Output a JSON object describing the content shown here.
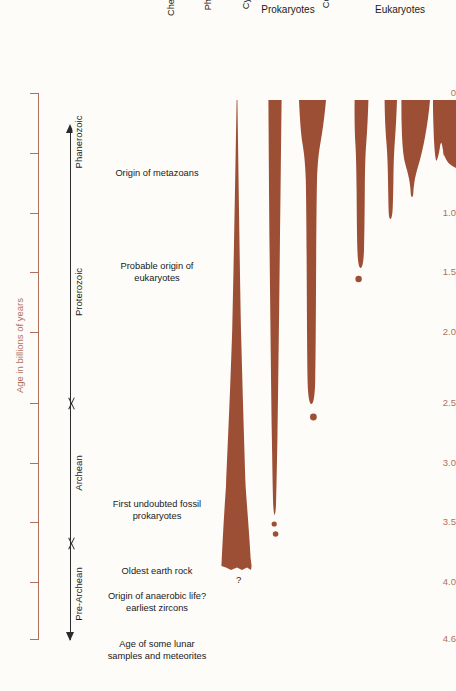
{
  "axis": {
    "title": "Age in billions of years",
    "unit": "billions of years",
    "color": "#b0705c",
    "ticks": [
      {
        "value": "0",
        "y": 93
      },
      {
        "value": "0.5",
        "y": 153
      },
      {
        "value": "1.0",
        "y": 213
      },
      {
        "value": "1.5",
        "y": 272
      },
      {
        "value": "2.0",
        "y": 332
      },
      {
        "value": "2.5",
        "y": 403
      },
      {
        "value": "3.0",
        "y": 463
      },
      {
        "value": "3.5",
        "y": 522
      },
      {
        "value": "4.0",
        "y": 582
      },
      {
        "value": "4.6",
        "y": 639
      }
    ],
    "range": [
      0,
      4.6
    ]
  },
  "eras": [
    {
      "label": "Phanerozoic",
      "top": 104,
      "bottom": 180
    },
    {
      "label": "Proterozoic",
      "top": 180,
      "bottom": 403
    },
    {
      "label": "Archean",
      "top": 403,
      "bottom": 543
    },
    {
      "label": "Pre-Archean",
      "top": 543,
      "bottom": 645
    }
  ],
  "era_boundaries": [
    {
      "name": "archean-proterozoic-boundary",
      "y": 403
    },
    {
      "name": "pre-archean-archean-boundary",
      "y": 543
    }
  ],
  "annotations": [
    {
      "text": "Origin of metazoans",
      "y": 173,
      "age": "0.7"
    },
    {
      "text": "Probable origin of\neukaryotes",
      "y": 272,
      "age": "1.5"
    },
    {
      "text": "First undoubted fossil\nprokaryotes",
      "y": 510,
      "age": "3.4"
    },
    {
      "text": "Oldest earth rock",
      "y": 571,
      "age": "3.8"
    },
    {
      "text": "Origin of anaerobic life?\nearliest zircons",
      "y": 602,
      "age": "4.0"
    },
    {
      "text": "Age of some lunar\nsamples and meteorites",
      "y": 650,
      "age": "4.6"
    }
  ],
  "groups": [
    {
      "label": "Prokaryotes",
      "x": 288,
      "width": 120
    },
    {
      "label": "Eukaryotes",
      "x": 400,
      "width": 110
    }
  ],
  "columns": [
    {
      "label": "Chemosynthetic\nbacteria",
      "group": "Prokaryotes",
      "head_x": 238,
      "center": 236,
      "top_age": "0",
      "bottom_age": "3.8",
      "uncertain": true
    },
    {
      "label": "Photosynthetic\nbacteria",
      "group": "Prokaryotes",
      "head_x": 275,
      "center": 275,
      "top_age": "0",
      "bottom_age": "3.5"
    },
    {
      "label": "Cyanobacteria",
      "group": "Prokaryotes",
      "head_x": 313,
      "center": 313,
      "top_age": "0",
      "bottom_age": "2.6"
    },
    {
      "label": "Green algae",
      "group": "Eukaryotes",
      "head_x": 363,
      "center": 361,
      "top_age": "0",
      "bottom_age": "1.45"
    },
    {
      "label": "Colonial algae",
      "group": "Eukaryotes",
      "head_x": 393,
      "center": 391,
      "top_age": "0",
      "bottom_age": "1.0"
    },
    {
      "label": "Invertebrate\nmetazoans",
      "group": "Eukaryotes",
      "head_x": 419,
      "center": 417,
      "top_age": "0",
      "bottom_age": "0.75"
    },
    {
      "label": "Vertebrate",
      "group": "Eukaryotes",
      "head_x": 449,
      "center": 448,
      "top_age": "0",
      "bottom_age": "0.6"
    }
  ],
  "uncertainty_marker": "?",
  "colors": {
    "bar": "#9d4f35",
    "axis": "#b0705c",
    "text": "#1a1a1a",
    "background": "#fdfcf8"
  },
  "chart_data": {
    "type": "area",
    "ylabel": "Age in billions of years",
    "ylim": [
      0,
      4.6
    ],
    "grid": false,
    "legend": "none",
    "series": [
      {
        "name": "Chemosynthetic bacteria",
        "first_appearance": 3.8,
        "extends_to_present": true,
        "uncertain_origin": true
      },
      {
        "name": "Photosynthetic bacteria",
        "first_appearance": 3.5,
        "extends_to_present": true
      },
      {
        "name": "Cyanobacteria",
        "first_appearance": 2.6,
        "extends_to_present": true
      },
      {
        "name": "Green algae",
        "first_appearance": 1.45,
        "extends_to_present": true
      },
      {
        "name": "Colonial algae",
        "first_appearance": 1.0,
        "extends_to_present": true
      },
      {
        "name": "Invertebrate metazoans",
        "first_appearance": 0.75,
        "extends_to_present": true
      },
      {
        "name": "Vertebrate",
        "first_appearance": 0.6,
        "extends_to_present": true
      }
    ],
    "events": [
      {
        "age": 0.7,
        "label": "Origin of metazoans"
      },
      {
        "age": 1.5,
        "label": "Probable origin of eukaryotes"
      },
      {
        "age": 3.4,
        "label": "First undoubted fossil prokaryotes"
      },
      {
        "age": 3.8,
        "label": "Oldest earth rock"
      },
      {
        "age": 4.0,
        "label": "Origin of anaerobic life? earliest zircons"
      },
      {
        "age": 4.6,
        "label": "Age of some lunar samples and meteorites"
      }
    ],
    "eras": [
      {
        "name": "Phanerozoic",
        "from": 0,
        "to": 0.6
      },
      {
        "name": "Proterozoic",
        "from": 0.6,
        "to": 2.5
      },
      {
        "name": "Archean",
        "from": 2.5,
        "to": 3.8
      },
      {
        "name": "Pre-Archean",
        "from": 3.8,
        "to": 4.6
      }
    ]
  }
}
